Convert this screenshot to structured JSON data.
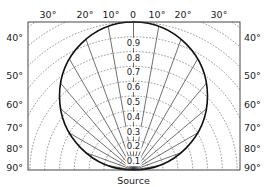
{
  "diagram": {
    "source_label": "Source",
    "top_angle_labels": [
      {
        "label": "30°",
        "x": 48
      },
      {
        "label": "20°",
        "x": 85
      },
      {
        "label": "10°",
        "x": 111
      },
      {
        "label": "0",
        "x": 133
      },
      {
        "label": "10°",
        "x": 157
      },
      {
        "label": "20°",
        "x": 183
      },
      {
        "label": "30°",
        "x": 219
      }
    ],
    "left_angle_labels": [
      {
        "label": "40°",
        "y": 41
      },
      {
        "label": "50°",
        "y": 79
      },
      {
        "label": "60°",
        "y": 108
      },
      {
        "label": "70°",
        "y": 131
      },
      {
        "label": "80°",
        "y": 152
      },
      {
        "label": "90°",
        "y": 171
      }
    ],
    "right_angle_labels": [
      {
        "label": "40°",
        "y": 41
      },
      {
        "label": "50°",
        "y": 79
      },
      {
        "label": "60°",
        "y": 108
      },
      {
        "label": "70°",
        "y": 131
      },
      {
        "label": "80°",
        "y": 152
      },
      {
        "label": "90°",
        "y": 171
      }
    ],
    "radial_labels": [
      "0.9",
      "0.8",
      "0.7",
      "0.6",
      "0.5",
      "0.4",
      "0.3",
      "0.2",
      "0.1"
    ],
    "ray_angles_deg": [
      -90,
      -80,
      -70,
      -60,
      -50,
      -40,
      -30,
      -20,
      -10,
      0,
      10,
      20,
      30,
      40,
      50,
      60,
      70,
      80,
      90
    ],
    "arc_fractions": [
      0.1,
      0.2,
      0.3,
      0.4,
      0.5,
      0.6,
      0.7,
      0.8,
      0.9,
      1.0,
      1.1,
      1.2,
      1.3,
      1.4,
      1.55
    ],
    "geometry": {
      "frame": {
        "x1": 28,
        "y1": 22,
        "x2": 240,
        "y2": 170
      },
      "source": {
        "x": 133.5,
        "y": 170
      },
      "full_radius": 148
    },
    "colors": {
      "pattern": "#111111",
      "rays": "#333333",
      "arcs": "#666666",
      "frame": "#333333"
    }
  }
}
